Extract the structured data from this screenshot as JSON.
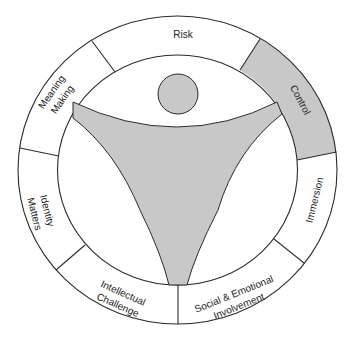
{
  "diagram": {
    "title": "",
    "colors": {
      "background": "#ffffff",
      "shade": "#c8c8c8",
      "line": "#2b2b2b",
      "text": "#222222"
    },
    "center_figure": {
      "description": "stylized person with raised arms (head circle and Y-shaped body)",
      "fill": "#c8c8c8"
    },
    "segments": [
      {
        "id": "risk",
        "lines": [
          "Risk"
        ],
        "shaded": false
      },
      {
        "id": "control",
        "lines": [
          "Control"
        ],
        "shaded": true
      },
      {
        "id": "immersion",
        "lines": [
          "Immersion"
        ],
        "shaded": false
      },
      {
        "id": "social-emotional-involvement",
        "lines": [
          "Social & Emotional",
          "Involvement"
        ],
        "shaded": false
      },
      {
        "id": "intellectual-challenge",
        "lines": [
          "Intellectual",
          "Challenge"
        ],
        "shaded": false
      },
      {
        "id": "identity-matters",
        "lines": [
          "Identity",
          "Matters"
        ],
        "shaded": false
      },
      {
        "id": "meaning-making",
        "lines": [
          "Meaning",
          "Making"
        ],
        "shaded": false
      }
    ]
  }
}
